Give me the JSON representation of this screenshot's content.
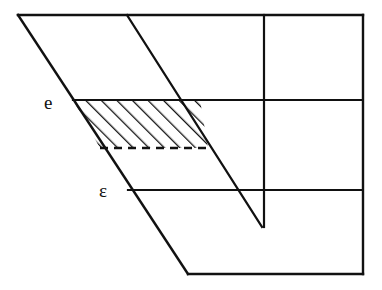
{
  "figure": {
    "background_color": "#ffffff",
    "stroke_color": "#111111",
    "canvas": {
      "width": 382,
      "height": 290
    },
    "labels": [
      {
        "id": "e",
        "text": "e",
        "x": 44,
        "y": 93
      },
      {
        "id": "epsilon",
        "text": "ε",
        "x": 99,
        "y": 181
      }
    ],
    "outline": {
      "name": "outer-boundary",
      "description": "Sheared quadrilateral frame: top edge, right edge, bottom edge, left slanted edge",
      "points": [
        [
          18,
          15
        ],
        [
          363,
          15
        ],
        [
          363,
          274
        ],
        [
          188,
          274
        ]
      ]
    },
    "lines": [
      {
        "name": "top-edge",
        "x1": 18,
        "y1": 15,
        "x2": 363,
        "y2": 15
      },
      {
        "name": "right-edge",
        "x1": 363,
        "y1": 15,
        "x2": 363,
        "y2": 274
      },
      {
        "name": "bottom-edge",
        "x1": 363,
        "y1": 274,
        "x2": 188,
        "y2": 274
      },
      {
        "name": "left-slant-edge",
        "x1": 188,
        "y1": 274,
        "x2": 18,
        "y2": 15
      },
      {
        "name": "inner-slant-edge",
        "x1": 127,
        "y1": 15,
        "x2": 262,
        "y2": 227
      },
      {
        "name": "vertical-divider",
        "x1": 264,
        "y1": 15,
        "x2": 264,
        "y2": 227
      },
      {
        "name": "horizontal-divider-upper",
        "x1": 73,
        "y1": 100,
        "x2": 362,
        "y2": 100
      },
      {
        "name": "horizontal-divider-lower",
        "x1": 128,
        "y1": 190,
        "x2": 362,
        "y2": 190
      }
    ],
    "dashed_lines": [
      {
        "name": "hatch-band-bottom-dashed",
        "x1": 100,
        "y1": 148,
        "x2": 208,
        "y2": 148,
        "dash": "8 6"
      }
    ],
    "hatched_region": {
      "name": "hatched-band",
      "description": "Parallelogram band between upper horizontal divider and dashed line, bounded by the two slanted edges",
      "points": [
        [
          73,
          100
        ],
        [
          200,
          100
        ],
        [
          208,
          148
        ],
        [
          100,
          148
        ]
      ],
      "hatch_angle_deg": 45,
      "hatch_spacing": 11,
      "hatch_direction": "bottom-left-to-top-right"
    }
  }
}
